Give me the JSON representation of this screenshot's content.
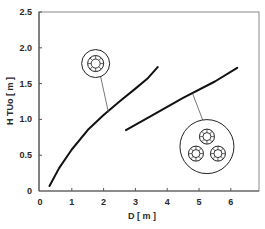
{
  "chart_data": {
    "type": "line",
    "title": "",
    "xlabel": "D [ m ]",
    "ylabel": "H TUo [ m ]",
    "xlim": [
      0,
      7
    ],
    "ylim": [
      0,
      2.5
    ],
    "x_ticks": [
      "0",
      "1",
      "2",
      "3",
      "4",
      "5",
      "6"
    ],
    "y_ticks": [
      "0",
      "0.5",
      "1.0",
      "1.5",
      "2.0",
      "2.5"
    ],
    "grid": false,
    "legend": "none",
    "series": [
      {
        "name": "single-tube bundle (one inner ring of tubes)",
        "x": [
          0.3,
          0.6,
          1.0,
          1.5,
          2.0,
          2.5,
          3.0,
          3.4,
          3.7
        ],
        "y": [
          0.07,
          0.32,
          0.58,
          0.85,
          1.06,
          1.25,
          1.43,
          1.58,
          1.73
        ],
        "icon": "single-bundle-icon"
      },
      {
        "name": "three-tube-bundle arrangement",
        "x": [
          2.7,
          3.5,
          4.5,
          5.5,
          6.2
        ],
        "y": [
          0.85,
          1.05,
          1.3,
          1.53,
          1.72
        ],
        "icon": "triple-bundle-icon"
      }
    ],
    "annotations": [
      {
        "type": "icon",
        "name": "single-bundle-icon",
        "position_data": [
          1.75,
          1.78
        ],
        "points_to": [
          2.15,
          1.1
        ]
      },
      {
        "type": "icon",
        "name": "triple-bundle-icon",
        "position_data": [
          5.25,
          0.62
        ],
        "points_to": [
          4.8,
          1.36
        ]
      }
    ]
  },
  "axes": {
    "x_label": "D [ m ]",
    "y_label": "H TUo [ m ]"
  }
}
